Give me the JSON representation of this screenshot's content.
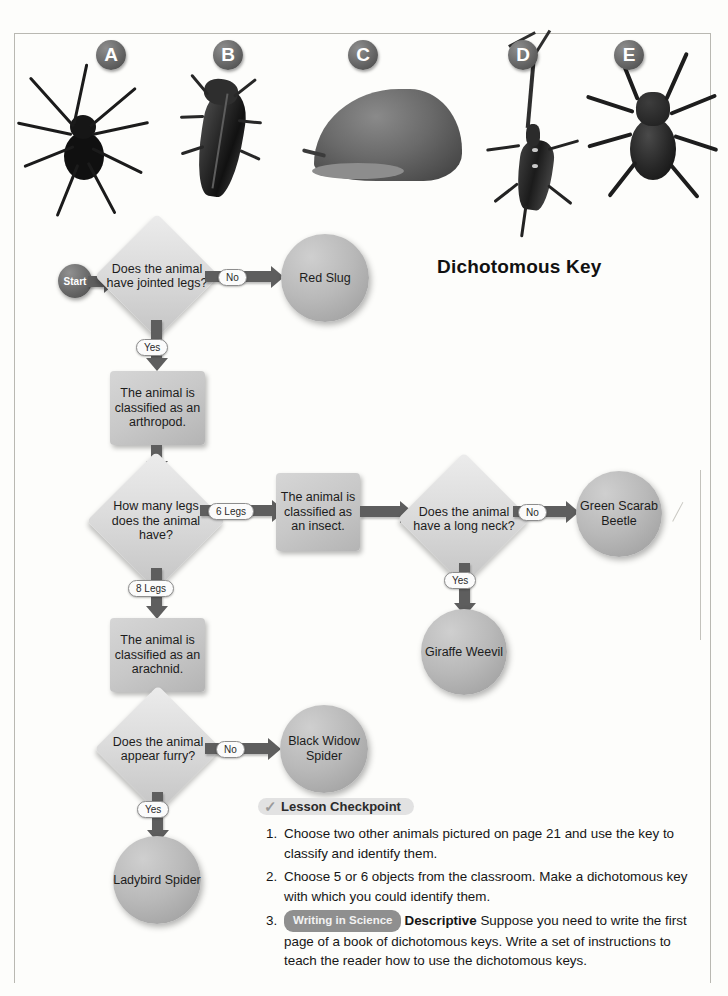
{
  "page": {
    "chart_title": "Dichotomous Key"
  },
  "specimens": [
    {
      "label": "A",
      "name": "black-widow-spider"
    },
    {
      "label": "B",
      "name": "green-scarab-beetle"
    },
    {
      "label": "C",
      "name": "red-slug"
    },
    {
      "label": "D",
      "name": "giraffe-weevil"
    },
    {
      "label": "E",
      "name": "ladybird-spider"
    }
  ],
  "flowchart": {
    "type": "flowchart",
    "start_label": "Start",
    "nodes": [
      {
        "id": "start",
        "shape": "start",
        "text": "Start"
      },
      {
        "id": "q-jointed",
        "shape": "diamond",
        "text": "Does the animal have jointed legs?"
      },
      {
        "id": "red-slug",
        "shape": "circle",
        "text": "Red Slug"
      },
      {
        "id": "arthropod",
        "shape": "rect",
        "text": "The animal is classified as an arthropod."
      },
      {
        "id": "q-legs",
        "shape": "diamond",
        "text": "How many legs does the animal have?"
      },
      {
        "id": "insect",
        "shape": "rect",
        "text": "The animal is classified as an insect."
      },
      {
        "id": "q-neck",
        "shape": "diamond",
        "text": "Does the animal have a long neck?"
      },
      {
        "id": "scarab",
        "shape": "circle",
        "text": "Green Scarab Beetle"
      },
      {
        "id": "weevil",
        "shape": "circle",
        "text": "Giraffe Weevil"
      },
      {
        "id": "arachnid",
        "shape": "rect",
        "text": "The animal is classified as an arachnid."
      },
      {
        "id": "q-furry",
        "shape": "diamond",
        "text": "Does the animal appear furry?"
      },
      {
        "id": "blackwidow",
        "shape": "circle",
        "text": "Black Widow Spider"
      },
      {
        "id": "ladybird",
        "shape": "circle",
        "text": "Ladybird Spider"
      }
    ],
    "edges": [
      {
        "from": "start",
        "to": "q-jointed",
        "label": ""
      },
      {
        "from": "q-jointed",
        "to": "red-slug",
        "label": "No"
      },
      {
        "from": "q-jointed",
        "to": "arthropod",
        "label": "Yes"
      },
      {
        "from": "arthropod",
        "to": "q-legs",
        "label": ""
      },
      {
        "from": "q-legs",
        "to": "insect",
        "label": "6 Legs"
      },
      {
        "from": "insect",
        "to": "q-neck",
        "label": ""
      },
      {
        "from": "q-neck",
        "to": "scarab",
        "label": "No"
      },
      {
        "from": "q-neck",
        "to": "weevil",
        "label": "Yes"
      },
      {
        "from": "q-legs",
        "to": "arachnid",
        "label": "8 Legs"
      },
      {
        "from": "arachnid",
        "to": "q-furry",
        "label": ""
      },
      {
        "from": "q-furry",
        "to": "blackwidow",
        "label": "No"
      },
      {
        "from": "q-furry",
        "to": "ladybird",
        "label": "Yes"
      }
    ]
  },
  "checkpoint": {
    "title": "Lesson Checkpoint",
    "check_glyph": "✓",
    "items": [
      {
        "number": "1.",
        "text": "Choose two other animals pictured on page 21 and use the key to classify and identify them."
      },
      {
        "number": "2.",
        "text": "Choose 5 or 6 objects from the classroom. Make a dichotomous key with which you could identify them."
      },
      {
        "number": "3.",
        "badge": "Writing in Science",
        "lead": "Descriptive",
        "text": "Suppose you need to write the first page of a book of dichotomous keys. Write a set of instructions to teach the reader how to use the dichotomous keys."
      }
    ]
  }
}
